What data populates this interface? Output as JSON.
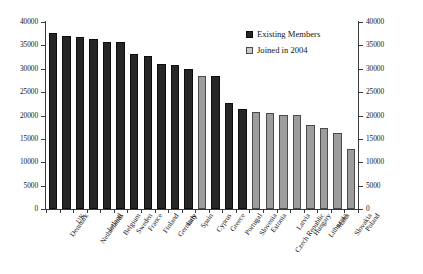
{
  "chart_data": {
    "type": "bar",
    "title": "",
    "subtitle": "",
    "xlabel": "",
    "ylabel": "",
    "ylim": [
      0,
      40000
    ],
    "ytick_step": 5000,
    "grid": false,
    "dual_y_axis": true,
    "legend_position": "top-right",
    "categories": [
      "Denmark",
      "UK",
      "Netherlands",
      "Ireland",
      "Belgium",
      "Sweden",
      "France",
      "Finland",
      "Germany",
      "Italy",
      "Spain",
      "Cyprus",
      "Greece",
      "Portugal",
      "Slovenia",
      "Estonia",
      "Czech Republic",
      "Latvia",
      "Hungary",
      "Lithuania",
      "Malta",
      "Slovakia",
      "Poland"
    ],
    "series": [
      {
        "name": "Existing Members",
        "color": "#262626",
        "values": [
          37700,
          37000,
          36700,
          36400,
          35700,
          35700,
          33100,
          32800,
          31100,
          30900,
          30000,
          null,
          28400,
          22600,
          21400,
          null,
          null,
          null,
          null,
          null,
          null,
          null,
          null
        ]
      },
      {
        "name": "Joined in 2004",
        "color": "#9d9d9d",
        "values": [
          null,
          null,
          null,
          null,
          null,
          null,
          null,
          null,
          null,
          null,
          null,
          28500,
          null,
          null,
          null,
          20800,
          20500,
          20100,
          20100,
          17900,
          17400,
          16300,
          12900
        ]
      }
    ],
    "y_axis_left": {
      "ticks": [
        "0",
        "5000",
        "10000",
        "15000",
        "20000",
        "25000",
        "30000",
        "35000",
        "40000"
      ]
    },
    "y_axis_right": {
      "ticks": [
        "0",
        "5000",
        "10000",
        "15000",
        "20000",
        "25000",
        "30000",
        "35000",
        "40000"
      ]
    },
    "legend": [
      {
        "label": "Existing Members",
        "swatch": "existing"
      },
      {
        "label": "Joined in 2004",
        "swatch": "joined"
      }
    ]
  }
}
